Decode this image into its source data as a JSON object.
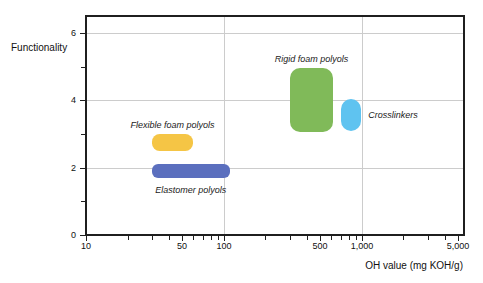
{
  "chart_data": {
    "type": "scatter",
    "mark": "rect-range",
    "title": "",
    "xlabel": "OH value (mg KOH/g)",
    "ylabel": "Functionality",
    "x_scale": "log",
    "xlim": [
      10,
      5500
    ],
    "ylim": [
      0,
      6.5
    ],
    "grid": "on",
    "x_ticks": [
      {
        "value": 10,
        "label": "10"
      },
      {
        "value": 50,
        "label": "50"
      },
      {
        "value": 100,
        "label": "100"
      },
      {
        "value": 500,
        "label": "500"
      },
      {
        "value": 1000,
        "label": "1,000"
      },
      {
        "value": 5000,
        "label": "5,000"
      }
    ],
    "x_minor_ticks": [
      20,
      30,
      40,
      60,
      70,
      80,
      90,
      200,
      300,
      400,
      600,
      700,
      800,
      900,
      2000,
      3000,
      4000
    ],
    "y_ticks": [
      {
        "value": 0,
        "label": "0"
      },
      {
        "value": 2,
        "label": "2"
      },
      {
        "value": 4,
        "label": "4"
      },
      {
        "value": 6,
        "label": "6"
      }
    ],
    "y_minor_ticks": [
      1,
      3,
      5
    ],
    "x_gridlines": [
      100,
      1000
    ],
    "y_gridlines": [
      2,
      4,
      6
    ],
    "regions": [
      {
        "name": "Flexible foam polyols",
        "color": "#F5C545",
        "oh_range": [
          30,
          60
        ],
        "functionality_range": [
          2.5,
          3.0
        ],
        "label_pos": "above"
      },
      {
        "name": "Elastomer polyols",
        "color": "#5B6FBE",
        "oh_range": [
          30,
          110
        ],
        "functionality_range": [
          1.7,
          2.1
        ],
        "label_pos": "below"
      },
      {
        "name": "Rigid foam polyols",
        "color": "#80BA59",
        "oh_range": [
          300,
          620
        ],
        "functionality_range": [
          3.05,
          4.95
        ],
        "label_pos": "above"
      },
      {
        "name": "Crosslinkers",
        "color": "#5FC3F0",
        "oh_range": [
          700,
          990
        ],
        "functionality_range": [
          3.1,
          4.05
        ],
        "label_pos": "right"
      }
    ],
    "colors": {
      "grid": "#cccccc",
      "frame": "#1f1f1f",
      "text": "#111111"
    }
  }
}
